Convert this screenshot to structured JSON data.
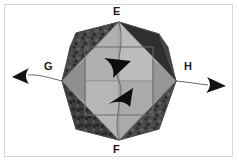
{
  "figure": {
    "kind": "polyhedron-rotation-axis-diagram",
    "caption_labels": {
      "top_vertex": "E",
      "bottom_vertex": "F",
      "left_axis": "G",
      "right_axis": "H"
    },
    "colors": {
      "background": "#ffffff",
      "frame_border": "#d8d8d8",
      "face_light": "#b4b4b4",
      "face_mid": "#9a9a9a",
      "face_dark": "#3c3c3c",
      "face_darker": "#2a2a2a",
      "face_textured": "#4a4a4a",
      "outline": "#555555",
      "square_edge": "#6b6b6b",
      "arrow_fill": "#111111",
      "label_text": "#1a1a1a",
      "axis_line": "#666666"
    },
    "geometry": {
      "top_vertex": [
        119,
        22
      ],
      "bottom_vertex": [
        119,
        140
      ],
      "left_vertex": [
        62,
        81
      ],
      "right_vertex": [
        176,
        81
      ],
      "inscribed_square": {
        "x": 85,
        "y": 47,
        "w": 68,
        "h": 68
      },
      "axis_left_arrow_tip": [
        14,
        78
      ],
      "axis_right_arrow_tip": [
        225,
        84
      ]
    },
    "annotations": {
      "rotation_arrow_upper": "down-right-arrowhead",
      "rotation_arrow_lower": "up-right-arrowhead",
      "axis_curve": "vertical-curved-axis-through-E-F"
    }
  }
}
